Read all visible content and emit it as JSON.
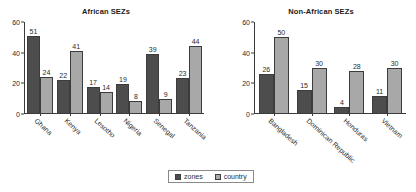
{
  "figure": {
    "background": "#ffffff",
    "series_colors": {
      "zones": "#4d4d4d",
      "country": "#a8a8a8"
    }
  },
  "legend": {
    "position": "bottom-center",
    "entries": [
      {
        "label": "zones",
        "color": "#4d4d4d",
        "swatch": "dark-square-swatch"
      },
      {
        "label": "country",
        "color": "#a8a8a8",
        "swatch": "light-square-swatch"
      }
    ]
  },
  "chart_data": [
    {
      "type": "bar",
      "title": "African SEZs",
      "xlabel": "",
      "ylabel": "",
      "ylim": [
        0,
        60
      ],
      "yticks": [
        0,
        20,
        40,
        60
      ],
      "grid": false,
      "legend_position": "bottom-center",
      "categories": [
        "Ghana",
        "Kenya",
        "Lesotho",
        "Nigeria",
        "Senegal",
        "Tanzania"
      ],
      "series": [
        {
          "name": "zones",
          "color": "#4d4d4d",
          "values": [
            51,
            22,
            17,
            19,
            39,
            23
          ]
        },
        {
          "name": "country",
          "color": "#a8a8a8",
          "values": [
            24,
            41,
            14,
            8,
            9,
            44
          ]
        }
      ]
    },
    {
      "type": "bar",
      "title": "Non-African SEZs",
      "xlabel": "",
      "ylabel": "",
      "ylim": [
        0,
        60
      ],
      "yticks": [
        0,
        20,
        40,
        60
      ],
      "grid": false,
      "legend_position": "bottom-center",
      "categories": [
        "Bangladesh",
        "Dominican Republic",
        "Honduras",
        "Vietnam"
      ],
      "series": [
        {
          "name": "zones",
          "color": "#4d4d4d",
          "values": [
            26,
            15,
            4,
            11
          ]
        },
        {
          "name": "country",
          "color": "#a8a8a8",
          "values": [
            50,
            30,
            28,
            30
          ]
        }
      ]
    }
  ]
}
